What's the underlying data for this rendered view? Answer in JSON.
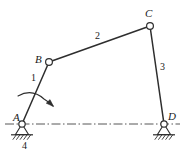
{
  "figure": {
    "kind": "four-bar-linkage-mechanism",
    "background_color": "#ffffff",
    "line_color": "#333333",
    "width": 183,
    "height": 156
  },
  "joints": [
    {
      "id": "A",
      "label": "A",
      "type": "fixed-pivot-ground",
      "x": 22,
      "y": 124,
      "label_x": 13,
      "label_y": 112
    },
    {
      "id": "B",
      "label": "B",
      "type": "revolute-pin",
      "x": 49,
      "y": 62,
      "label_x": 35,
      "label_y": 54
    },
    {
      "id": "C",
      "label": "C",
      "type": "revolute-pin",
      "x": 150,
      "y": 26,
      "label_x": 145,
      "label_y": 8
    },
    {
      "id": "D",
      "label": "D",
      "type": "fixed-pivot-ground",
      "x": 164,
      "y": 124,
      "label_x": 168,
      "label_y": 111
    }
  ],
  "links": [
    {
      "id": "1",
      "label": "1",
      "from": "A",
      "to": "B",
      "label_x": 31,
      "label_y": 73,
      "role": "crank"
    },
    {
      "id": "2",
      "label": "2",
      "from": "B",
      "to": "C",
      "label_x": 95,
      "label_y": 31,
      "role": "coupler"
    },
    {
      "id": "3",
      "label": "3",
      "from": "C",
      "to": "D",
      "label_x": 160,
      "label_y": 62,
      "role": "rocker"
    },
    {
      "id": "4",
      "label": "4",
      "from": "A",
      "to": "D",
      "label_x": 22,
      "label_y": 141,
      "role": "ground-frame"
    }
  ],
  "centerline": {
    "name": "ground-centerline",
    "style": "dash-dot",
    "y": 124,
    "x_start": 5,
    "x_end": 180
  },
  "rotation_arrow": {
    "name": "crank-rotation-arrow",
    "description": "curved arc with arrowhead indicating crank rotation direction",
    "direction": "clockwise"
  },
  "supports": [
    {
      "at": "A",
      "name": "ground-hatching-a"
    },
    {
      "at": "D",
      "name": "ground-hatching-d"
    }
  ]
}
